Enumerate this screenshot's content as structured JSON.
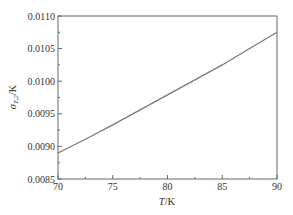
{
  "chart_data": {
    "type": "line",
    "title": "",
    "xlabel": "T/K",
    "ylabel": "σ_{T,2}/K",
    "xlim": [
      70,
      90
    ],
    "ylim": [
      0.0085,
      0.011
    ],
    "xticks": [
      70,
      75,
      80,
      85,
      90
    ],
    "xtick_labels": [
      "70",
      "75",
      "80",
      "85",
      "90"
    ],
    "yticks": [
      0.0085,
      0.009,
      0.0095,
      0.01,
      0.0105,
      0.011
    ],
    "ytick_labels": [
      "0.0085",
      "0.0090",
      "0.0095",
      "0.0100",
      "0.0105",
      "0.0110"
    ],
    "grid": false,
    "legend": null,
    "series": [
      {
        "name": "sigma_T2",
        "color": "#777777",
        "x": [
          70,
          72.5,
          75,
          77.5,
          80,
          82.5,
          85,
          87.5,
          90
        ],
        "y": [
          0.0089,
          0.00911,
          0.00933,
          0.00956,
          0.00979,
          0.01002,
          0.01025,
          0.0105,
          0.01075
        ]
      }
    ]
  }
}
